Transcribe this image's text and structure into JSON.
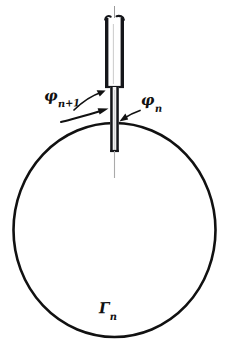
{
  "figure": {
    "background_color": "#ffffff",
    "ink_color": "#111111",
    "width": 229,
    "height": 344,
    "labels": {
      "phi_next": {
        "symbol": "φ",
        "subscript": "n+1"
      },
      "phi_current": {
        "symbol": "φ",
        "subscript": "n"
      },
      "contour": {
        "symbol": "Γ",
        "subscript": "n"
      }
    },
    "parts": {
      "circle_name": "contour-circle",
      "probe_body_name": "probe-body",
      "probe_shaft_name": "probe-shaft",
      "probe_tip_name": "probe-tip",
      "axis_name": "center-axis",
      "arrow_left_name": "leader-arrow-phi-next",
      "arrow_curve_name": "curved-arrow-phi-next",
      "arrow_right_name": "leader-arrow-phi-n"
    },
    "geometry": {
      "circle_center_x": 114.5,
      "circle_center_y": 230,
      "circle_radius_x": 101,
      "circle_radius_y": 107,
      "contact_point_x": 114.5,
      "contact_point_y": 123
    }
  }
}
